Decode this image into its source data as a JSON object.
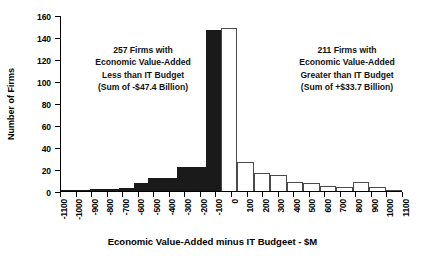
{
  "chart_data": {
    "type": "bar",
    "title": "",
    "xlabel": "Economic Value-Added minus IT Budgeet - $M",
    "ylabel": "Number of Firms",
    "ylim": [
      0,
      160
    ],
    "yticks": [
      0,
      20,
      40,
      60,
      80,
      100,
      120,
      140,
      160
    ],
    "xlim": [
      -1100,
      1100
    ],
    "xticks": [
      -1100,
      -1000,
      -900,
      -800,
      -700,
      -600,
      -500,
      -400,
      -300,
      -200,
      -100,
      0,
      100,
      200,
      300,
      400,
      500,
      600,
      700,
      800,
      900,
      1000,
      1100
    ],
    "xtick_labels": [
      "-1100",
      "-1000",
      "-900",
      "-800",
      "-700",
      "-600",
      "-500",
      "-400",
      "-300",
      "-200",
      "-100",
      "0",
      "100",
      "200",
      "300",
      "400",
      "500",
      "600",
      "700",
      "800",
      "900",
      "1000",
      "1100"
    ],
    "grid": false,
    "legend": "none",
    "bin_width": 100,
    "categories": [
      "-1100",
      "-1000",
      "-900",
      "-800",
      "-700",
      "-600",
      "-500",
      "-400",
      "-300",
      "-200",
      "-100",
      "0",
      "100",
      "200",
      "300",
      "400",
      "500",
      "600",
      "700",
      "800",
      "900",
      "1000"
    ],
    "values": [
      1,
      1,
      2,
      2,
      3,
      7,
      12,
      12,
      22,
      22,
      146,
      148,
      26,
      16,
      15,
      8,
      7,
      5,
      4,
      8,
      4,
      1
    ],
    "bar_styles": [
      "filled",
      "filled",
      "filled",
      "filled",
      "filled",
      "filled",
      "filled",
      "filled",
      "filled",
      "filled",
      "filled",
      "outline",
      "outline",
      "outline",
      "outline",
      "outline",
      "outline",
      "outline",
      "outline",
      "outline",
      "outline",
      "outline"
    ],
    "colors": {
      "negative_fill": "#1a1a1a",
      "positive_fill": "#ffffff",
      "positive_stroke": "#4a4a4a",
      "axis": "#000000",
      "text": "#000000"
    },
    "annotations": [
      {
        "position": "left",
        "lines": [
          "257 Firms with",
          "Economic Value-Added",
          "Less than IT Budget",
          "(Sum of -$47.4 Billion)"
        ]
      },
      {
        "position": "right",
        "lines": [
          "211 Firms with",
          "Economic Value-Added",
          "Greater than IT Budget",
          "(Sum of +$33.7 Billion)"
        ]
      }
    ]
  }
}
